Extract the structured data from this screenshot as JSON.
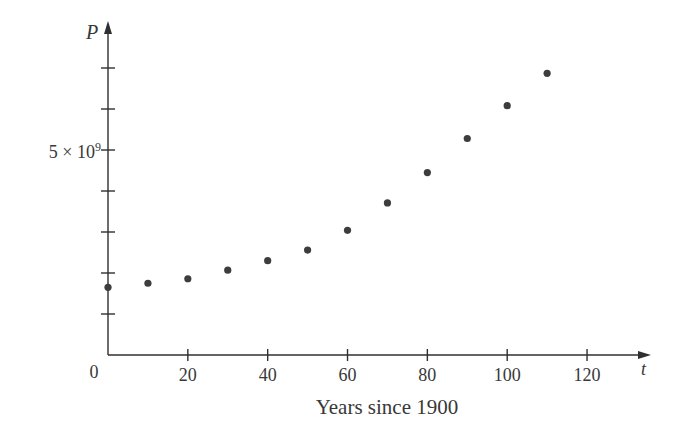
{
  "figure": {
    "background": "#ffffff",
    "ink_color": "#383838",
    "axis_color": "#2f2f2f",
    "dot_color": "#3d3d3d"
  },
  "chart_data": {
    "type": "scatter",
    "title": "",
    "xlabel": "Years since 1900",
    "ylabel": "",
    "x_axis_symbol": "t",
    "y_axis_symbol": "P",
    "x": [
      0,
      10,
      20,
      30,
      40,
      50,
      60,
      70,
      80,
      90,
      100,
      110
    ],
    "y_population_1e9": [
      1.65,
      1.75,
      1.86,
      2.07,
      2.3,
      2.56,
      3.04,
      3.71,
      4.45,
      5.28,
      6.08,
      6.87
    ],
    "y_unit": "10^9",
    "x_ticks": [
      20,
      40,
      60,
      80,
      100,
      120
    ],
    "origin_label": "0",
    "y_ticks_1e9": [
      1,
      2,
      3,
      4,
      5,
      6,
      7
    ],
    "y_tick_label": {
      "base": "5 × 10",
      "exp": "9",
      "at_1e9": 5
    },
    "xlim": [
      0,
      135
    ],
    "ylim_1e9": [
      0,
      8.1
    ],
    "grid": false,
    "legend": null
  }
}
